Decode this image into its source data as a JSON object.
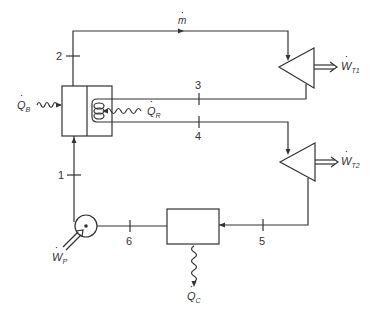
{
  "diagram": {
    "type": "dual-turbine steam power cycle schematic",
    "colors": {
      "line": "#333333",
      "background": "#ffffff"
    },
    "states": [
      "1",
      "2",
      "3",
      "4",
      "5",
      "6"
    ],
    "labels": {
      "mass_flow": "m",
      "boiler_heat": {
        "base": "Q",
        "sub": "B"
      },
      "reheat_heat": {
        "base": "Q",
        "sub": "R"
      },
      "turbine1_work": {
        "base": "W",
        "sub": "T1"
      },
      "turbine2_work": {
        "base": "W",
        "sub": "T2"
      },
      "pump_work": {
        "base": "W",
        "sub": "P"
      },
      "condenser_heat": {
        "base": "Q",
        "sub": "C"
      }
    },
    "components": [
      {
        "id": "boiler-reheater",
        "icon": "boiler-box"
      },
      {
        "id": "turbine-1",
        "icon": "turbine-triangle"
      },
      {
        "id": "turbine-2",
        "icon": "turbine-triangle"
      },
      {
        "id": "condenser",
        "icon": "condenser-box"
      },
      {
        "id": "pump",
        "icon": "pump-circle"
      }
    ]
  }
}
